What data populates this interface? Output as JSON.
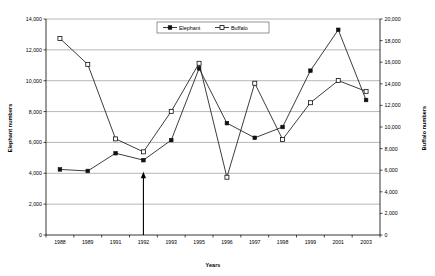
{
  "chart_data": {
    "type": "line",
    "title": "",
    "xlabel": "Years",
    "categories": [
      "1988",
      "1989",
      "1991",
      "1992",
      "1993",
      "1995",
      "1996",
      "1997",
      "1998",
      "1999",
      "2001",
      "2003"
    ],
    "series": [
      {
        "name": "Elephant",
        "axis": "left",
        "marker": "filled-square",
        "values": [
          4250,
          4150,
          5300,
          4850,
          6150,
          10800,
          7250,
          6300,
          7000,
          10650,
          13300,
          8750
        ]
      },
      {
        "name": "Buffalo",
        "axis": "right",
        "marker": "open-square",
        "values": [
          18200,
          15800,
          8900,
          7700,
          11450,
          15900,
          5350,
          14050,
          8850,
          12250,
          14300,
          13300
        ]
      }
    ],
    "axes": {
      "left": {
        "label": "Elephant numbers",
        "ylim": [
          0,
          14000
        ],
        "step": 2000,
        "ticks": [
          "0",
          "2,000",
          "4,000",
          "6,000",
          "8,000",
          "10,000",
          "12,000",
          "14,000"
        ]
      },
      "right": {
        "label": "Buffalo numbers",
        "ylim": [
          0,
          20000
        ],
        "step": 2000,
        "ticks": [
          "0",
          "2,000",
          "4,000",
          "6,000",
          "8,000",
          "10,000",
          "12,000",
          "14,000",
          "16,000",
          "18,000",
          "20,000"
        ]
      }
    },
    "grid": true,
    "legend": {
      "position": "top-center",
      "entries": [
        "Elephant",
        "Buffalo"
      ]
    },
    "annotations": [
      {
        "name": "up-arrow-1992",
        "type": "arrow",
        "category": "1992",
        "points_to_value": 4000,
        "from_value": 0
      }
    ],
    "colors": {
      "line": "#1a1a1a",
      "grid": "#868686",
      "axis": "#000000",
      "background": "#ffffff"
    }
  }
}
